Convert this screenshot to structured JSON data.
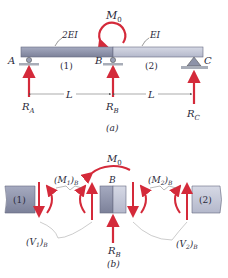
{
  "figure_a": {
    "caption": "(a)",
    "moment_label": "M",
    "moment_sub": "0",
    "segment1_rigidity": "2EI",
    "segment2_rigidity": "EI",
    "support_A": "A",
    "support_B": "B",
    "support_C": "C",
    "segment1_label": "(1)",
    "segment2_label": "(2)",
    "span1": "L",
    "span2": "L",
    "reaction_A": "R",
    "reaction_A_sub": "A",
    "reaction_B": "R",
    "reaction_B_sub": "B",
    "reaction_C": "R",
    "reaction_C_sub": "C"
  },
  "figure_b": {
    "caption": "(b)",
    "moment_label": "M",
    "moment_sub": "0",
    "joint_label": "B",
    "segment1_label": "(1)",
    "segment2_label": "(2)",
    "m1_label": "(M",
    "m1_sub": "1",
    "m1_close": ")",
    "m1_sub2": "B",
    "m2_label": "(M",
    "m2_sub": "2",
    "m2_close": ")",
    "m2_sub2": "B",
    "v1_label": "(V",
    "v1_sub": "1",
    "v1_close": ")",
    "v1_sub2": "B",
    "v2_label": "(V",
    "v2_sub": "2",
    "v2_close": ")",
    "v2_sub2": "B",
    "reaction_B": "R",
    "reaction_B_sub": "B"
  },
  "colors": {
    "force_red": "#d42a3a",
    "beam_dark": "#8a8fa8",
    "beam_light": "#c4c8d8",
    "ground": "#a8adb8"
  }
}
